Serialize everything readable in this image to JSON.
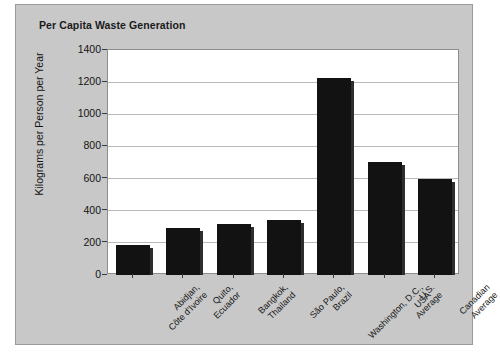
{
  "chart_data": {
    "type": "bar",
    "title": "Per Capita Waste Generation",
    "xlabel": "",
    "ylabel": "Kilograms per Person per Year",
    "ylim": [
      0,
      1400
    ],
    "yticks": [
      0,
      200,
      400,
      600,
      800,
      1000,
      1200,
      1400
    ],
    "grid": true,
    "legend": "none",
    "bar_color": "#121212",
    "plot_background": "#ffffff",
    "figure_background": "#c8c8c8",
    "categories": [
      "Abidjan, Côte d'Ivoire",
      "Quito, Ecuador",
      "Bangkok, Thailand",
      "São Paulo, Brazil",
      "Washington, D.C., USA",
      "U.S. Average",
      "Canadian Average"
    ],
    "category_lines": [
      [
        "Abidjan,",
        "Côte d'Ivoire"
      ],
      [
        "Quito,",
        "Ecuador"
      ],
      [
        "Bangkok,",
        "Thailand"
      ],
      [
        "São Paulo,",
        "Brazil"
      ],
      [
        "Washington, D.C.,",
        "USA"
      ],
      [
        "U.S.",
        "Average"
      ],
      [
        "Canadian",
        "Average"
      ]
    ],
    "values": [
      185,
      290,
      320,
      345,
      1225,
      705,
      595
    ]
  }
}
